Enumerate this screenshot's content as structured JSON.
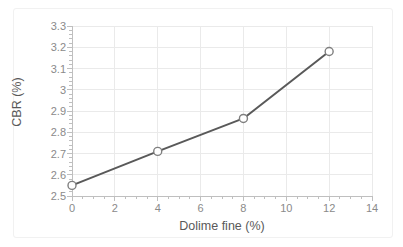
{
  "chart_data": {
    "type": "line",
    "title": "",
    "xlabel": "Dolime fine (%)",
    "ylabel": "CBR (%)",
    "x": [
      0,
      4,
      8,
      12
    ],
    "values": [
      2.55,
      2.71,
      2.865,
      3.18
    ],
    "series": [
      {
        "name": "CBR",
        "x": [
          0,
          4,
          8,
          12
        ],
        "values": [
          2.55,
          2.71,
          2.865,
          3.18
        ]
      }
    ],
    "xlim": [
      0,
      14
    ],
    "ylim": [
      2.5,
      3.3
    ],
    "xticks": [
      0,
      2,
      4,
      6,
      8,
      10,
      12,
      14
    ],
    "xtick_labels": [
      "0",
      "2",
      "4",
      "6",
      "8",
      "10",
      "12",
      "14"
    ],
    "yticks": [
      2.5,
      2.6,
      2.7,
      2.8,
      2.9,
      3.0,
      3.1,
      3.2,
      3.3
    ],
    "ytick_labels": [
      "2.5",
      "2.6",
      "2.7",
      "2.8",
      "2.9",
      "3",
      "3.1",
      "3.2",
      "3.3"
    ],
    "grid": true,
    "grid_x": true,
    "grid_y": true,
    "legend": false,
    "legend_position": "none",
    "line_color": "#595959",
    "marker": "circle-open",
    "marker_face_color": "#ffffff",
    "marker_edge_color": "#7f7f7f",
    "grid_color": "#eaeaea",
    "tick_color": "#bfbfbf",
    "tick_label_color": "#8a8a8a",
    "axis_label_color": "#595959"
  }
}
